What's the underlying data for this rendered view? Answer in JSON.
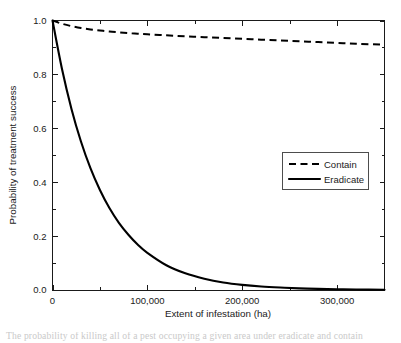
{
  "figure": {
    "background_color": "#ffffff",
    "line_color": "#000000",
    "axis_color": "#1a1a1a",
    "caption": "The probability of killing all of a pest occupying a given area under eradicate and contain"
  },
  "chart_data": {
    "type": "line",
    "title": "",
    "xlabel": "Extent of infestation (ha)",
    "ylabel": "Probability of treatment success",
    "xlim": [
      0,
      350000
    ],
    "ylim": [
      0.0,
      1.0
    ],
    "grid": false,
    "legend_position": "center-right-inside",
    "x_ticks": [
      0,
      100000,
      200000,
      300000
    ],
    "x_tick_labels": [
      "0",
      "100,000",
      "200,000",
      "300,000"
    ],
    "x_minor_ticks": [
      50000,
      150000,
      250000,
      350000
    ],
    "y_ticks": [
      0.0,
      0.2,
      0.4,
      0.6,
      0.8,
      1.0
    ],
    "y_tick_labels": [
      "0.0",
      "0.2",
      "0.4",
      "0.6",
      "0.8",
      "1.0"
    ],
    "y_minor_ticks": [
      0.1,
      0.3,
      0.5,
      0.7,
      0.9
    ],
    "x": [
      0,
      10000,
      20000,
      30000,
      40000,
      50000,
      60000,
      70000,
      80000,
      90000,
      100000,
      120000,
      140000,
      160000,
      180000,
      200000,
      220000,
      240000,
      260000,
      280000,
      300000,
      320000,
      350000
    ],
    "series": [
      {
        "name": "Contain",
        "style": "dashed",
        "color": "#000000",
        "values": [
          1.0,
          0.988,
          0.979,
          0.972,
          0.967,
          0.963,
          0.959,
          0.956,
          0.953,
          0.951,
          0.949,
          0.945,
          0.941,
          0.938,
          0.935,
          0.932,
          0.929,
          0.926,
          0.923,
          0.92,
          0.917,
          0.914,
          0.91
        ]
      },
      {
        "name": "Eradicate",
        "style": "solid",
        "color": "#000000",
        "values": [
          1.0,
          0.82,
          0.672,
          0.551,
          0.452,
          0.371,
          0.304,
          0.249,
          0.205,
          0.168,
          0.138,
          0.092,
          0.062,
          0.042,
          0.028,
          0.019,
          0.013,
          0.009,
          0.006,
          0.004,
          0.003,
          0.002,
          0.001
        ]
      }
    ]
  },
  "legend": {
    "items": [
      {
        "label": "Contain",
        "style": "dashed"
      },
      {
        "label": "Eradicate",
        "style": "solid"
      }
    ]
  }
}
